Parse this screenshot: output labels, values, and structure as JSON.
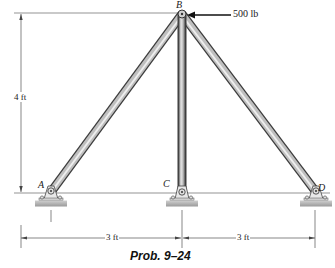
{
  "figure": {
    "caption": "Prob. 9–24",
    "points": {
      "A": "A",
      "B": "B",
      "C": "C",
      "D": "D"
    },
    "load": {
      "label": "500 lb",
      "point": "B",
      "direction": "left"
    },
    "dimensions": {
      "height": "4 ft",
      "span_AC": "3 ft",
      "span_CD": "3 ft"
    },
    "members": [
      "AB",
      "CB",
      "DB"
    ],
    "supports": [
      "A",
      "C",
      "D"
    ],
    "colors": {
      "member_dark": "#5a5a5a",
      "member_light": "#d8d8d8",
      "ground": "#b8b8b8",
      "line": "#555555"
    }
  }
}
